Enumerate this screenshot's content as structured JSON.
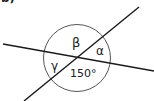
{
  "figure": {
    "part_label": "b)",
    "angle_labels": {
      "beta": "β",
      "alpha": "α",
      "gamma": "γ",
      "given_angle": "150°"
    },
    "colors": {
      "stroke": "#1a1a1a",
      "circle": "#555555",
      "text": "#222222"
    }
  }
}
